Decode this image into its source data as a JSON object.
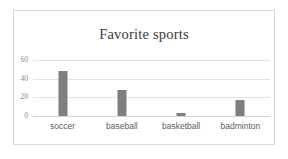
{
  "chart_data": {
    "type": "bar",
    "title": "Favorite sports",
    "xlabel": "",
    "ylabel": "",
    "categories": [
      "soccer",
      "baseball",
      "basketball",
      "badminton"
    ],
    "values": [
      48,
      28,
      3,
      17
    ],
    "ylim": [
      0,
      60
    ],
    "yticks": [
      0,
      20,
      40,
      60
    ],
    "ytick_labels": [
      "0",
      "20",
      "40",
      "60"
    ],
    "grid": true,
    "legend": false,
    "series": [
      {
        "name": "Favorite sports",
        "values": [
          48,
          28,
          3,
          17
        ],
        "color": "#7f7f7f"
      }
    ]
  },
  "colors": {
    "bar": "#7f7f7f",
    "gridline": "#e4e4e4",
    "baseline": "#d2d2d2",
    "frame": "#d9d9d9",
    "title_text": "#3a3a3a",
    "ytick_text": "#8a8a8a",
    "xtick_text": "#5e5e5e",
    "background": "#ffffff"
  }
}
